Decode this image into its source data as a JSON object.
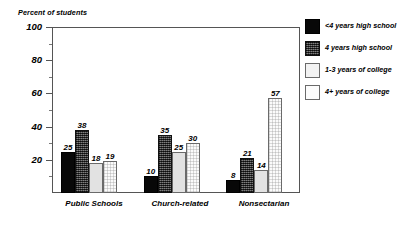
{
  "chart_data": {
    "type": "bar",
    "title": "",
    "ylabel": "Percent of students",
    "xlabel": "",
    "ylim": [
      0,
      100
    ],
    "yticks": [
      20,
      40,
      60,
      80,
      100
    ],
    "ytick_labels": [
      "20",
      "40",
      "60",
      "80",
      "100"
    ],
    "grid": false,
    "legend_position": "right",
    "categories": [
      "Public Schools",
      "Church-related",
      "Nonsectarian"
    ],
    "series": [
      {
        "name": "<4 years high school",
        "values": [
          25,
          10,
          8
        ]
      },
      {
        "name": "4 years high school",
        "values": [
          38,
          35,
          21
        ]
      },
      {
        "name": "1-3 years of college",
        "values": [
          18,
          25,
          14
        ]
      },
      {
        "name": "4+ years of college",
        "values": [
          19,
          30,
          57
        ]
      }
    ],
    "value_labels": [
      [
        "25",
        "38",
        "18",
        "19"
      ],
      [
        "10",
        "35",
        "25",
        "30"
      ],
      [
        "8",
        "21",
        "14",
        "57"
      ]
    ]
  },
  "axis": {
    "y_title": "Percent of students",
    "y_labels": [
      "100",
      "80",
      "60",
      "40",
      "20"
    ]
  },
  "categories": {
    "c0": "Public Schools",
    "c1": "Church-related",
    "c2": "Nonsectarian"
  },
  "legend": {
    "items": [
      {
        "label": "<4 years high school",
        "swatch": "solid-black-swatch"
      },
      {
        "label": "4 years high school",
        "swatch": "dark-hatch-swatch"
      },
      {
        "label": "1-3 years of college",
        "swatch": "light-gray-swatch"
      },
      {
        "label": "4+ years of college",
        "swatch": "white-dotted-swatch"
      }
    ]
  },
  "values": {
    "g0": {
      "b0": "25",
      "b1": "38",
      "b2": "18",
      "b3": "19"
    },
    "g1": {
      "b0": "10",
      "b1": "35",
      "b2": "25",
      "b3": "30"
    },
    "g2": {
      "b0": "8",
      "b1": "21",
      "b2": "14",
      "b3": "57"
    }
  }
}
